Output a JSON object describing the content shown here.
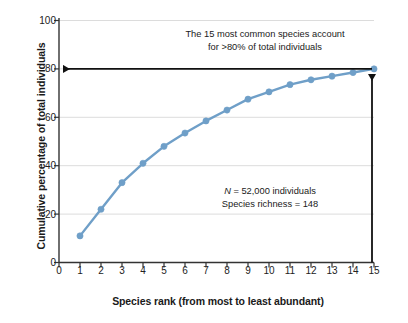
{
  "chart_data": {
    "type": "line",
    "title": "",
    "xlabel": "Species rank (from most to least abundant)",
    "ylabel": "Cumulative percentage of total individuals",
    "xlim": [
      0,
      15
    ],
    "ylim": [
      0,
      100
    ],
    "xticks": [
      "0",
      "1",
      "2",
      "3",
      "4",
      "5",
      "6",
      "7",
      "8",
      "9",
      "10",
      "11",
      "12",
      "13",
      "14",
      "15"
    ],
    "yticks": [
      "0",
      "20",
      "40",
      "60",
      "80",
      "100"
    ],
    "grid": "horizontal",
    "legend": "none",
    "x": [
      1,
      2,
      3,
      4,
      5,
      6,
      7,
      8,
      9,
      10,
      11,
      12,
      13,
      14,
      15
    ],
    "values": [
      11,
      22,
      33,
      41,
      48,
      53.5,
      58.5,
      63,
      67.5,
      70.5,
      73.5,
      75.5,
      77,
      78.5,
      80
    ],
    "series": [
      {
        "name": "Cumulative percentage of total individuals",
        "color": "#6f9fc8",
        "marker": "circle",
        "values": [
          11,
          22,
          33,
          41,
          48,
          53.5,
          58.5,
          63,
          67.5,
          70.5,
          73.5,
          75.5,
          77,
          78.5,
          80
        ]
      }
    ],
    "annotations": [
      {
        "name": "callout-top",
        "line1": "The 15 most common species account",
        "line2": "for >80% of total individuals"
      },
      {
        "name": "stats",
        "line1_prefix": "N",
        "line1_rest": " = 52,000 individuals",
        "line2": "Species richness = 148"
      }
    ],
    "arrows": [
      {
        "name": "horizontal-arrow-to-80",
        "from": [
          15,
          80
        ],
        "to": [
          0,
          80
        ],
        "color": "#111111"
      },
      {
        "name": "vertical-arrow-at-15",
        "from": [
          15,
          0
        ],
        "to": [
          15,
          80
        ],
        "color": "#111111"
      }
    ]
  },
  "colors": {
    "series": "#6f9fc8",
    "axis": "#333333",
    "grid": "#d9d9d9",
    "text": "#1a1a1a",
    "arrow": "#111111",
    "background": "#ffffff"
  }
}
